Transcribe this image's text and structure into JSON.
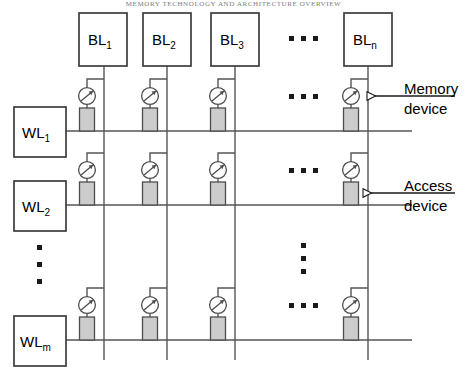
{
  "page_header": "MEMORY TECHNOLOGY AND ARCHITECTURE  OVERVIEW",
  "diagram": {
    "name": "crossbar-memory-array",
    "bitlines": [
      {
        "id": "bl1",
        "label": "BL",
        "sub": "1",
        "x": 104
      },
      {
        "id": "bl2",
        "label": "BL",
        "sub": "2",
        "x": 167
      },
      {
        "id": "bl3",
        "label": "BL",
        "sub": "3",
        "x": 235
      },
      {
        "id": "bln",
        "label": "BL",
        "sub": "n",
        "x": 368
      }
    ],
    "wordlines": [
      {
        "id": "wl1",
        "label": "WL",
        "sub": "1",
        "y": 131
      },
      {
        "id": "wl2",
        "label": "WL",
        "sub": "2",
        "y": 205
      },
      {
        "id": "wlm",
        "label": "WL",
        "sub": "m",
        "y": 340
      }
    ],
    "column_ellipsis": {
      "label": "horizontal-ellipsis",
      "x": 303
    },
    "row_ellipsis": {
      "label": "vertical-ellipsis",
      "y": 262
    },
    "cell": {
      "access_symbol": "circle-with-diagonal-arrow",
      "memory_symbol": "gray-rectangle",
      "memory_fill": "#cccccc",
      "memory_stroke": "#4d4d4d"
    },
    "callouts": [
      {
        "id": "memory-device",
        "line1": "Memory",
        "line2": "device",
        "target": "access-symbol-row1"
      },
      {
        "id": "access-device",
        "line1": "Access",
        "line2": "device",
        "target": "memory-symbol-row2"
      }
    ],
    "colors": {
      "wire": "#555555",
      "box_stroke": "#3c3c3c",
      "background": "#ffffff"
    }
  }
}
